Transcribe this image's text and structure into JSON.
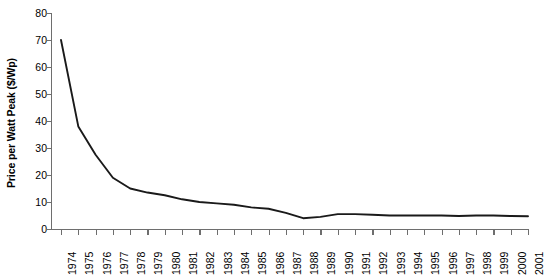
{
  "chart_data": {
    "type": "line",
    "title": "",
    "xlabel": "",
    "ylabel": "Price per Watt Peak ($/Wp)",
    "ylim": [
      0,
      80
    ],
    "ytick_values": [
      0,
      10,
      20,
      30,
      40,
      50,
      60,
      70,
      80
    ],
    "ytick_labels": [
      "0",
      "10",
      "20",
      "30",
      "40",
      "50",
      "60",
      "70",
      "80"
    ],
    "grid": false,
    "legend": null,
    "line_color": "#1a1a1a",
    "categories": [
      "1974",
      "1975",
      "1976",
      "1977",
      "1978",
      "1979",
      "1980",
      "1981",
      "1982",
      "1983",
      "1984",
      "1985",
      "1986",
      "1987",
      "1988",
      "1989",
      "1990",
      "1991",
      "1992",
      "1993",
      "1994",
      "1995",
      "1996",
      "1997",
      "1998",
      "1999",
      "2000",
      "2001"
    ],
    "values": [
      70,
      38,
      27.5,
      19,
      15,
      13.5,
      12.5,
      11,
      10,
      9.5,
      9,
      8,
      7.5,
      6,
      4,
      4.5,
      5.5,
      5.5,
      5.3,
      5,
      5,
      5,
      5,
      4.8,
      5,
      5,
      4.8,
      4.7
    ],
    "series": [
      {
        "name": "Price per Watt Peak",
        "values": [
          70,
          38,
          27.5,
          19,
          15,
          13.5,
          12.5,
          11,
          10,
          9.5,
          9,
          8,
          7.5,
          6,
          4,
          4.5,
          5.5,
          5.5,
          5.3,
          5,
          5,
          5,
          5,
          4.8,
          5,
          5,
          4.8,
          4.7
        ]
      }
    ]
  }
}
